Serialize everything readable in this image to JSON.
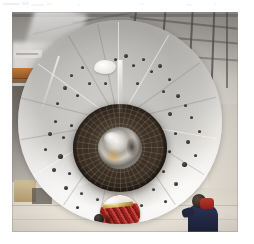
{
  "page": {
    "background_color": "#ffffff",
    "width": 254,
    "height": 244
  },
  "artifacts": {
    "description": "faint scan marks along top edge of page",
    "color": "#d9d9dd"
  },
  "photo": {
    "caption": "",
    "alt_description": "Large circular industrial component viewed head-on inside a factory hall, with a dark textured central hub, a reflective metallic core, scattered bolt holes across its pale gray face, a red and white round object near the bottom, and a worker in dark blue at lower right.",
    "frame": {
      "x": 12,
      "y": 12,
      "width": 226,
      "height": 220
    },
    "background": {
      "name": "factory-hall",
      "roof_color": "#4a4641",
      "wall_color": "#a5a29d",
      "floor_color": "#efe9de",
      "beam_color": "#c4752f"
    },
    "disc": {
      "name": "circular-component",
      "surface_color": "#cdcbc7",
      "highlight_color": "#fbf9f5",
      "diameter_px": 204,
      "bolt_hole_color": "#26241f",
      "paint_patch_color": "#ffffff"
    },
    "hub": {
      "name": "central-hub",
      "color": "#3a3026",
      "core_color": "#d6d3cd",
      "core_warm_color": "#cda050"
    },
    "red_object": {
      "name": "red-white-round-object",
      "red_color": "#9e2320",
      "white_color": "#f4f2ee",
      "stripe_color": "#c9a23a"
    },
    "worker": {
      "name": "worker",
      "clothing_color": "#1d2340",
      "accent_color": "#c0392b"
    },
    "holes": [
      {
        "x": 52,
        "y": 54,
        "size": "sm"
      },
      {
        "x": 63,
        "y": 46,
        "size": "sm"
      },
      {
        "x": 45,
        "y": 66,
        "size": "md"
      },
      {
        "x": 38,
        "y": 82,
        "size": "sm"
      },
      {
        "x": 58,
        "y": 74,
        "size": "sm"
      },
      {
        "x": 70,
        "y": 62,
        "size": "sm"
      },
      {
        "x": 96,
        "y": 38,
        "size": "sm"
      },
      {
        "x": 106,
        "y": 34,
        "size": "md"
      },
      {
        "x": 114,
        "y": 44,
        "size": "sm"
      },
      {
        "x": 124,
        "y": 38,
        "size": "sm"
      },
      {
        "x": 132,
        "y": 50,
        "size": "sm"
      },
      {
        "x": 140,
        "y": 44,
        "size": "md"
      },
      {
        "x": 150,
        "y": 58,
        "size": "sm"
      },
      {
        "x": 144,
        "y": 70,
        "size": "sm"
      },
      {
        "x": 158,
        "y": 74,
        "size": "md"
      },
      {
        "x": 166,
        "y": 84,
        "size": "sm"
      },
      {
        "x": 150,
        "y": 92,
        "size": "md"
      },
      {
        "x": 172,
        "y": 96,
        "size": "sm"
      },
      {
        "x": 36,
        "y": 100,
        "size": "sm"
      },
      {
        "x": 30,
        "y": 112,
        "size": "md"
      },
      {
        "x": 44,
        "y": 116,
        "size": "sm"
      },
      {
        "x": 52,
        "y": 104,
        "size": "sm"
      },
      {
        "x": 26,
        "y": 128,
        "size": "sm"
      },
      {
        "x": 40,
        "y": 134,
        "size": "lg"
      },
      {
        "x": 56,
        "y": 128,
        "size": "sm"
      },
      {
        "x": 34,
        "y": 148,
        "size": "md"
      },
      {
        "x": 50,
        "y": 152,
        "size": "sm"
      },
      {
        "x": 62,
        "y": 142,
        "size": "sm"
      },
      {
        "x": 46,
        "y": 166,
        "size": "md"
      },
      {
        "x": 62,
        "y": 172,
        "size": "sm"
      },
      {
        "x": 70,
        "y": 158,
        "size": "sm"
      },
      {
        "x": 58,
        "y": 186,
        "size": "sm"
      },
      {
        "x": 78,
        "y": 178,
        "size": "sm"
      },
      {
        "x": 92,
        "y": 186,
        "size": "sm"
      },
      {
        "x": 156,
        "y": 112,
        "size": "sm"
      },
      {
        "x": 168,
        "y": 120,
        "size": "md"
      },
      {
        "x": 150,
        "y": 130,
        "size": "sm"
      },
      {
        "x": 164,
        "y": 142,
        "size": "lg"
      },
      {
        "x": 144,
        "y": 150,
        "size": "sm"
      },
      {
        "x": 156,
        "y": 162,
        "size": "md"
      },
      {
        "x": 134,
        "y": 168,
        "size": "sm"
      },
      {
        "x": 146,
        "y": 180,
        "size": "sm"
      },
      {
        "x": 122,
        "y": 184,
        "size": "sm"
      },
      {
        "x": 110,
        "y": 192,
        "size": "sm"
      },
      {
        "x": 176,
        "y": 134,
        "size": "sm"
      },
      {
        "x": 180,
        "y": 110,
        "size": "sm"
      },
      {
        "x": 86,
        "y": 62,
        "size": "sm"
      },
      {
        "x": 118,
        "y": 62,
        "size": "sm"
      }
    ]
  }
}
